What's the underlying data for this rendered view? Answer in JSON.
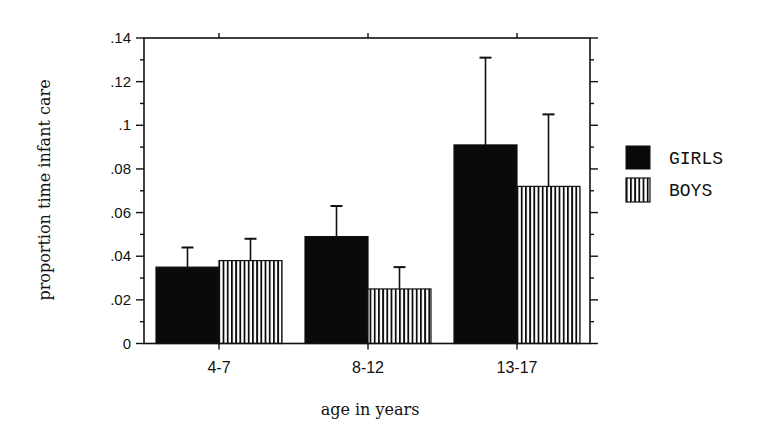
{
  "chart_data": {
    "type": "bar",
    "title": "",
    "xlabel": "age in years",
    "ylabel": "proportion time infant care",
    "categories": [
      "4-7",
      "8-12",
      "13-17"
    ],
    "series": [
      {
        "name": "GIRLS",
        "fill": "solid",
        "color": "#0a0a0a",
        "values": [
          0.035,
          0.049,
          0.091
        ],
        "error_upper": [
          0.044,
          0.063,
          0.131
        ]
      },
      {
        "name": "BOYS",
        "fill": "vertical-stripes",
        "color": "#0a0a0a",
        "values": [
          0.038,
          0.025,
          0.072
        ],
        "error_upper": [
          0.048,
          0.035,
          0.105
        ]
      }
    ],
    "ylim": [
      0,
      0.14
    ],
    "yticks": [
      0,
      0.02,
      0.04,
      0.06,
      0.08,
      0.1,
      0.12,
      0.14
    ],
    "ytick_labels": [
      "0",
      ".02",
      ".04",
      ".06",
      ".08",
      ".1",
      ".12",
      ".14"
    ],
    "yminor_step": 0.01,
    "grid": false,
    "legend_position": "right",
    "error_bars": "upper only"
  }
}
